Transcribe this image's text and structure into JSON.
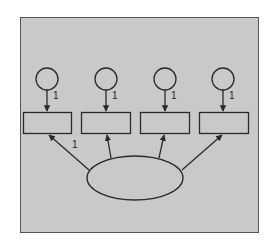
{
  "diagram": {
    "type": "structural-equation-model",
    "colors": {
      "page_background": "#ffffff",
      "panel_background": "#c9c9c9",
      "stroke": "#2a2a2a"
    },
    "latent_factor": {
      "shape": "ellipse",
      "label": ""
    },
    "indicators": [
      {
        "shape": "rectangle",
        "label": ""
      },
      {
        "shape": "rectangle",
        "label": ""
      },
      {
        "shape": "rectangle",
        "label": ""
      },
      {
        "shape": "rectangle",
        "label": ""
      }
    ],
    "error_terms": [
      {
        "shape": "circle",
        "label": "",
        "path_label": "1"
      },
      {
        "shape": "circle",
        "label": "",
        "path_label": "1"
      },
      {
        "shape": "circle",
        "label": "",
        "path_label": "1"
      },
      {
        "shape": "circle",
        "label": "",
        "path_label": "1"
      }
    ],
    "factor_loadings": [
      {
        "to_indicator": 1,
        "label": "1"
      },
      {
        "to_indicator": 2,
        "label": ""
      },
      {
        "to_indicator": 3,
        "label": ""
      },
      {
        "to_indicator": 4,
        "label": ""
      }
    ]
  }
}
